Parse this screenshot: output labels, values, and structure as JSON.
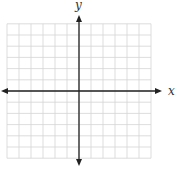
{
  "diagram": {
    "type": "coordinate-grid",
    "x_axis_label": "x",
    "y_axis_label": "y",
    "grid": {
      "cells_left_of_origin": 6,
      "cells_right_of_origin": 6,
      "cells_above_origin": 6,
      "cells_below_origin": 6
    },
    "colors": {
      "grid_line": "#d4d4d4",
      "axis": "#222222",
      "background": "#ffffff"
    }
  }
}
